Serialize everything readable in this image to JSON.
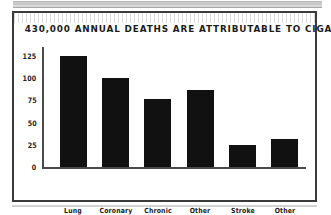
{
  "chart_data": {
    "type": "bar",
    "title": "430,000 ANNUAL DEATHS ARE ATTRIBUTABLE TO CIGARETTE SMOKING",
    "xlabel": "",
    "ylabel": "",
    "categories": [
      "Lung\nCancer",
      "Coronary\nHeart\nDisease",
      "Chronic\nLung\nDisease",
      "Other\nDiagnosis",
      "Stroke",
      "Other\nCancers"
    ],
    "values": [
      125,
      100,
      76,
      87,
      25,
      32
    ],
    "ylim": [
      0,
      135
    ],
    "yticks": [
      "0",
      "25",
      "50",
      "75",
      "100",
      "125"
    ],
    "ytick_values": [
      0,
      25,
      50,
      75,
      100,
      125
    ],
    "grid": false,
    "legend": false,
    "bar_color": "#111111",
    "axis_color": "#4a4a4a",
    "frame_color": "#3a3a3a",
    "background": "#ffffff"
  }
}
